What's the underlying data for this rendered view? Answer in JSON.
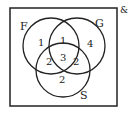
{
  "diagram": {
    "type": "venn",
    "corner_mark": "&",
    "sets": [
      {
        "label": "F"
      },
      {
        "label": "G"
      },
      {
        "label": "S"
      }
    ],
    "regions": {
      "F_only": "1",
      "FG_only": "1",
      "G_only": "4",
      "FS_only": "2",
      "FGS": "3",
      "GS_only": "2",
      "S_only": "2"
    }
  }
}
